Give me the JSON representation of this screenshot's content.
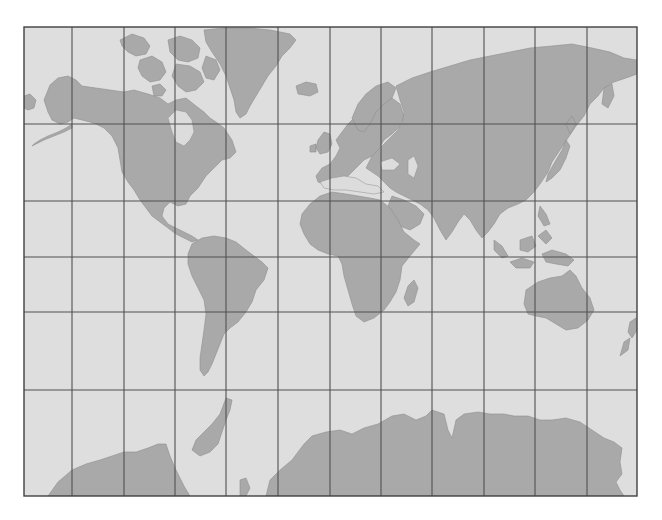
{
  "map": {
    "projection": "Mercator",
    "colors": {
      "ocean": "#dedede",
      "land": "#a9a9a9",
      "coast": "#8e8e8e",
      "grid": "#505050",
      "frame": "#404040",
      "background": "#ffffff"
    },
    "frame": {
      "x": 24,
      "y": 27,
      "width": 613,
      "height": 469
    },
    "grid": {
      "meridians_x": [
        72,
        124,
        175,
        226,
        278,
        330,
        381,
        432,
        484,
        535,
        587
      ],
      "parallels_y": [
        124,
        201,
        257,
        312,
        390
      ]
    },
    "landmasses": [
      "North America",
      "Greenland",
      "Canadian Arctic Archipelago",
      "South America",
      "Europe",
      "Africa",
      "Madagascar",
      "Asia",
      "Japan",
      "Indonesia",
      "Australia",
      "New Zealand",
      "Antarctica",
      "British Isles",
      "Iceland"
    ],
    "labels": []
  }
}
